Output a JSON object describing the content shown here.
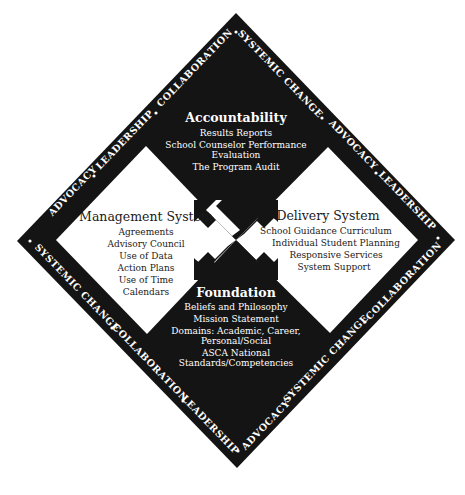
{
  "colors": {
    "background": "#ffffff",
    "dark": "#141414",
    "light_text": "#1a1a1a",
    "dark_text": "#ffffff"
  },
  "quadrants": {
    "accountability": {
      "title": "Accountability",
      "items": [
        "Results Reports",
        "School Counselor Performance",
        "Evaluation",
        "The Program Audit"
      ]
    },
    "management": {
      "title": "Management System",
      "items": [
        "Agreements",
        "Advisory Council",
        "Use of Data",
        "Action Plans",
        "Use of Time",
        "Calendars"
      ]
    },
    "delivery": {
      "title": "Delivery System",
      "items": [
        "School Guidance Curriculum",
        "Individual Student Planning",
        "Responsive Services",
        "System Support"
      ]
    },
    "foundation": {
      "title": "Foundation",
      "items": [
        "Beliefs and Philosophy",
        "Mission Statement",
        "Domains: Academic, Career,",
        "Personal/Social",
        "ASCA National",
        "Standards/Competencies"
      ]
    }
  },
  "border": {
    "top_left": [
      "ADVOCACY",
      "LEADERSHIP",
      "COLLABORATION"
    ],
    "top_right": [
      "SYSTEMIC CHANGE",
      "ADVOCACY",
      "LEADERSHIP"
    ],
    "bottom_left": [
      "SYSTEMIC CHANGE",
      "COLLABORATION",
      "LEADERSHIP"
    ],
    "bottom_right": [
      "ADVOCACY",
      "SYSTEMIC CHANGE",
      "COLLABORATION"
    ]
  },
  "arrows": [
    "up-left",
    "up-right",
    "down-left",
    "down-right"
  ]
}
